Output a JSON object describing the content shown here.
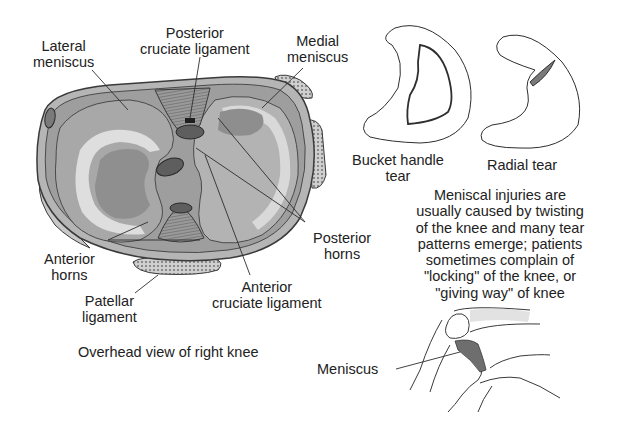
{
  "figure": {
    "main_view": {
      "caption": "Overhead view of right knee",
      "labels": {
        "lateral_meniscus": [
          "Lateral",
          "meniscus"
        ],
        "posterior_cruciate": [
          "Posterior",
          "cruciate ligament"
        ],
        "medial_meniscus": [
          "Medial",
          "meniscus"
        ],
        "posterior_horns": [
          "Posterior",
          "horns"
        ],
        "anterior_horns": [
          "Anterior",
          "horns"
        ],
        "patellar_ligament": [
          "Patellar",
          "ligament"
        ],
        "anterior_cruciate": [
          "Anterior",
          "cruciate ligament"
        ]
      }
    },
    "tear_types": [
      {
        "name": "bucket-handle",
        "label": [
          "Bucket handle",
          "tear"
        ]
      },
      {
        "name": "radial",
        "label": [
          "Radial tear"
        ]
      }
    ],
    "description": [
      "Meniscal injuries are",
      "usually caused by twisting",
      "of the knee and many tear",
      "patterns emerge; patients",
      "sometimes complain of",
      "\"locking\" of the knee, or",
      "\"giving way\" of knee"
    ],
    "side_view": {
      "label": "Meniscus"
    },
    "colors": {
      "outline": "#3a3a3a",
      "tissue_dark": "#8c8c8c",
      "tissue_mid": "#a9a9a9",
      "tissue_light": "#cfcfcf",
      "highlight": "#e4e4e4",
      "ligament_dark": "#5e5e5e"
    }
  }
}
